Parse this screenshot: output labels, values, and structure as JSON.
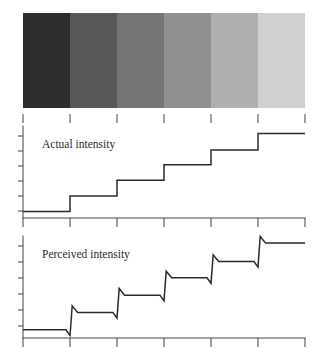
{
  "figure": {
    "title_semantic": "mach-bands-illustration",
    "plot_left": 23,
    "plot_right": 305
  },
  "strip": {
    "name": "grayscale-band-strip",
    "x": 23,
    "y": 13,
    "width": 282,
    "height": 95,
    "band_count": 6,
    "band_colors": [
      "#2e2e2e",
      "#585858",
      "#747474",
      "#909090",
      "#b0b0b0",
      "#d0d0d0"
    ],
    "band_labels": [
      "band-1",
      "band-2",
      "band-3",
      "band-4",
      "band-5",
      "band-6"
    ]
  },
  "xticks": {
    "name": "x-axis-ticks",
    "positions": [
      23,
      70,
      117,
      164,
      211,
      258,
      305
    ],
    "count": 7
  },
  "charts": [
    {
      "name": "actual-intensity-chart",
      "label": "Actual intensity",
      "label_x": 42,
      "label_y": 148,
      "top": 128,
      "baseline": 218,
      "y_ticks": [
        136,
        151,
        166,
        181,
        196,
        211
      ],
      "series_name": "actual",
      "step_values": [
        0.07,
        0.24,
        0.41,
        0.58,
        0.74,
        0.92
      ],
      "ylim": [
        0,
        1
      ],
      "grid": false
    },
    {
      "name": "perceived-intensity-chart",
      "label": "Perceived intensity",
      "label_x": 42,
      "label_y": 258,
      "top": 238,
      "baseline": 338,
      "y_ticks": [
        246,
        262,
        278,
        294,
        310,
        326
      ],
      "series_name": "perceived",
      "step_values": [
        0.08,
        0.25,
        0.42,
        0.59,
        0.75,
        0.93
      ],
      "undershoot": 0.055,
      "overshoot": 0.065,
      "ylim": [
        0,
        1
      ],
      "grid": false
    }
  ],
  "chart_data": {
    "type": "line",
    "xlabel": "",
    "ylabel": "Intensity",
    "categories": [
      "band-1",
      "band-2",
      "band-3",
      "band-4",
      "band-5",
      "band-6"
    ],
    "x_edges": [
      0,
      1,
      2,
      3,
      4,
      5,
      6
    ],
    "series": [
      {
        "name": "Actual intensity",
        "type": "step",
        "values": [
          0.07,
          0.24,
          0.41,
          0.58,
          0.74,
          0.92
        ]
      },
      {
        "name": "Perceived intensity",
        "type": "step-with-mach-bands",
        "values": [
          0.08,
          0.25,
          0.42,
          0.59,
          0.75,
          0.93
        ],
        "undershoot_depth": 0.055,
        "overshoot_height": 0.065,
        "note": "Each luminance edge shows a dark undershoot on the darker side and a bright overshoot on the lighter side."
      }
    ],
    "strip_gray_levels": [
      "#2e2e2e",
      "#585858",
      "#747474",
      "#909090",
      "#b0b0b0",
      "#d0d0d0"
    ],
    "ylim": [
      0,
      1
    ],
    "grid": false,
    "legend": "none"
  }
}
